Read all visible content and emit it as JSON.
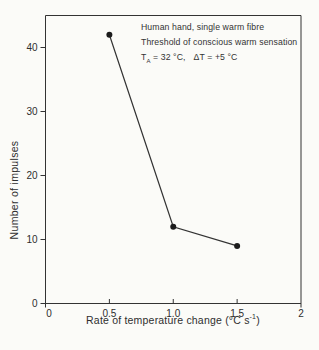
{
  "figure": {
    "background": "#fbfbf8",
    "ink": "#333333",
    "point_color": "#1c1c1c"
  },
  "annotation_parts": {
    "t": "T",
    "t_sub": "A",
    "rest": " = 32 °C,",
    "delta": "ΔT = +5 °C"
  },
  "axis_titles": {
    "x_prefix": "Rate of temperature change (°C s",
    "x_sup": "-1",
    "x_suffix": ")",
    "y": "Number of impulses"
  },
  "chart_data": {
    "type": "line",
    "title": "",
    "series": [
      {
        "name": "Warm fibre impulse count",
        "x": [
          0.5,
          1.0,
          1.5
        ],
        "y": [
          42,
          12,
          9
        ]
      }
    ],
    "annotations": [
      "Human hand, single warm fibre",
      "Threshold of conscious warm sensation",
      "T_A = 32 °C,  ΔT = +5 °C"
    ],
    "xlabel": "Rate of temperature change (°C s⁻¹)",
    "ylabel": "Number of impulses",
    "xlim": [
      0,
      2
    ],
    "ylim": [
      0,
      45
    ],
    "x_ticks": {
      "values": [
        0,
        0.5,
        1.0,
        1.5,
        2
      ],
      "labels": [
        "0",
        "0.5",
        "1.0",
        "1.5",
        "2"
      ]
    },
    "y_ticks": {
      "values": [
        0,
        10,
        20,
        30,
        40
      ],
      "labels": [
        "0",
        "10",
        "20",
        "30",
        "40"
      ]
    },
    "marker": "filled-circle",
    "frame": "box",
    "grid": false,
    "legend": "none",
    "line_color": "#333333"
  }
}
